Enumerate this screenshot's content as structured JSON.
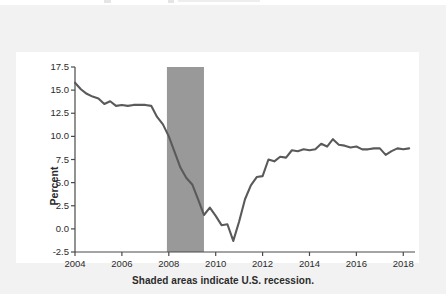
{
  "figure": {
    "background_color": "#f2f2f2",
    "plot_background_color": "#ffffff",
    "line_color": "#5a5a5a",
    "recession_band_color": "#999999",
    "axis_color": "#4a4a4a",
    "text_color": "#2b2b2b"
  },
  "chart_data": {
    "type": "line",
    "title": "",
    "subtitle": "",
    "xlabel": "",
    "ylabel": "Percent",
    "annotation": "Shaded areas indicate U.S. recession.",
    "grid": false,
    "legend": "none",
    "xlim": [
      2004.0,
      2018.5
    ],
    "ylim": [
      -2.5,
      17.5
    ],
    "xticks": [
      2004,
      2006,
      2008,
      2010,
      2012,
      2014,
      2016,
      2018
    ],
    "xtick_labels": [
      "2004",
      "2006",
      "2008",
      "2010",
      "2012",
      "2014",
      "2016",
      "2018"
    ],
    "yticks": [
      -2.5,
      0.0,
      2.5,
      5.0,
      7.5,
      10.0,
      12.5,
      15.0,
      17.5
    ],
    "ytick_labels": [
      "-2.5",
      "0.0",
      "2.5",
      "5.0",
      "7.5",
      "10.0",
      "12.5",
      "15.0",
      "17.5"
    ],
    "shaded_regions": [
      {
        "label": "U.S. recession",
        "x_start": 2007.92,
        "x_end": 2009.5,
        "color": "#999999"
      }
    ],
    "series": [
      {
        "name": "Percent",
        "color": "#5a5a5a",
        "x": [
          2004.0,
          2004.25,
          2004.5,
          2004.75,
          2005.0,
          2005.25,
          2005.5,
          2005.75,
          2006.0,
          2006.25,
          2006.5,
          2006.75,
          2007.0,
          2007.25,
          2007.5,
          2007.75,
          2008.0,
          2008.25,
          2008.5,
          2008.75,
          2009.0,
          2009.25,
          2009.5,
          2009.75,
          2010.0,
          2010.25,
          2010.5,
          2010.75,
          2011.0,
          2011.25,
          2011.5,
          2011.75,
          2012.0,
          2012.25,
          2012.5,
          2012.75,
          2013.0,
          2013.25,
          2013.5,
          2013.75,
          2014.0,
          2014.25,
          2014.5,
          2014.75,
          2015.0,
          2015.25,
          2015.5,
          2015.75,
          2016.0,
          2016.25,
          2016.5,
          2016.75,
          2017.0,
          2017.25,
          2017.5,
          2017.75,
          2018.0,
          2018.25
        ],
        "y": [
          15.8,
          15.1,
          14.6,
          14.3,
          14.1,
          13.5,
          13.8,
          13.3,
          13.4,
          13.3,
          13.4,
          13.4,
          13.4,
          13.3,
          12.1,
          11.3,
          10.0,
          8.3,
          6.6,
          5.5,
          4.8,
          3.2,
          1.5,
          2.3,
          1.4,
          0.4,
          0.5,
          -1.3,
          0.8,
          3.2,
          4.7,
          5.6,
          5.7,
          7.5,
          7.3,
          7.8,
          7.7,
          8.5,
          8.4,
          8.6,
          8.5,
          8.6,
          9.2,
          8.9,
          9.7,
          9.1,
          9.0,
          8.8,
          8.9,
          8.6,
          8.6,
          8.7,
          8.7,
          8.0,
          8.4,
          8.7,
          8.6,
          8.7
        ]
      }
    ]
  },
  "labels": {
    "y_axis_title": "Percent",
    "x_caption": "Shaded areas indicate U.S. recession."
  }
}
